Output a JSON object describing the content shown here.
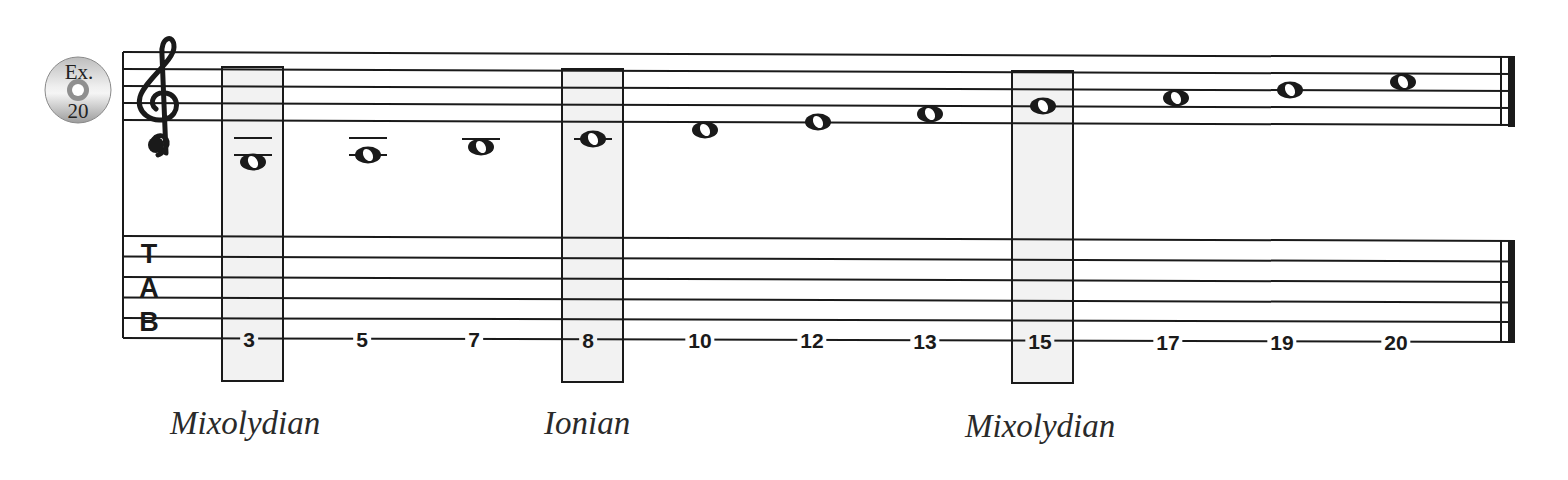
{
  "example_badge": {
    "icon": "cd-disc-icon",
    "line1": "Ex.",
    "line2": "20"
  },
  "staff": {
    "clef": "treble-clef",
    "notes": [
      {
        "x": 253,
        "y": 162,
        "ledgers": [
          138,
          155
        ]
      },
      {
        "x": 368,
        "y": 155,
        "ledgers": [
          138,
          155
        ]
      },
      {
        "x": 481,
        "y": 147,
        "ledgers": [
          139
        ]
      },
      {
        "x": 593,
        "y": 139,
        "ledgers": [
          139
        ]
      },
      {
        "x": 705,
        "y": 130,
        "ledgers": []
      },
      {
        "x": 818,
        "y": 122,
        "ledgers": []
      },
      {
        "x": 930,
        "y": 114,
        "ledgers": []
      },
      {
        "x": 1043,
        "y": 106,
        "ledgers": []
      },
      {
        "x": 1176,
        "y": 98,
        "ledgers": []
      },
      {
        "x": 1290,
        "y": 90,
        "ledgers": []
      },
      {
        "x": 1403,
        "y": 82,
        "ledgers": []
      }
    ]
  },
  "tab": {
    "letters": [
      "T",
      "A",
      "B"
    ],
    "frets": [
      "3",
      "5",
      "7",
      "8",
      "10",
      "12",
      "13",
      "15",
      "17",
      "19",
      "20"
    ],
    "fret_x": [
      249,
      362,
      474,
      588,
      700,
      812,
      925,
      1040,
      1168,
      1282,
      1396
    ]
  },
  "highlights": [
    {
      "note_index": 0,
      "label": "Mixolydian"
    },
    {
      "note_index": 3,
      "label": "Ionian"
    },
    {
      "note_index": 7,
      "label": "Mixolydian"
    }
  ],
  "labels": {
    "first": "Mixolydian",
    "second": "Ionian",
    "third": "Mixolydian"
  },
  "frets_text": {
    "f0": "3",
    "f1": "5",
    "f2": "7",
    "f3": "8",
    "f4": "10",
    "f5": "12",
    "f6": "13",
    "f7": "15",
    "f8": "17",
    "f9": "19",
    "f10": "20"
  },
  "colors": {
    "ink": "#1a1a1a",
    "highlight_fill": "#f2f2f2"
  }
}
